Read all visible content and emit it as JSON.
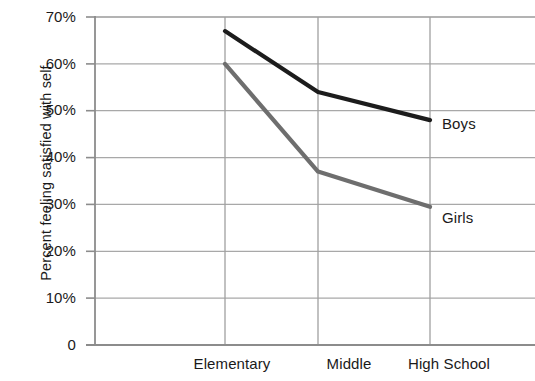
{
  "chart_data": {
    "type": "line",
    "title": "",
    "xlabel": "",
    "ylabel": "Percent feeling satisfied with self",
    "categories": [
      "Elementary",
      "Middle",
      "High School"
    ],
    "series": [
      {
        "name": "Boys",
        "values": [
          67,
          54,
          48
        ],
        "color": "#1c1c1c"
      },
      {
        "name": "Girls",
        "values": [
          60,
          37,
          29.5
        ],
        "color": "#6e6e6e"
      }
    ],
    "ylim": [
      0,
      70
    ],
    "ytick_values": [
      0,
      10,
      20,
      30,
      40,
      50,
      60,
      70
    ],
    "ytick_labels": [
      "0",
      "10%",
      "20%",
      "30%",
      "40%",
      "50%",
      "60%",
      "70%"
    ],
    "grid": "horizontal-and-category-verticals",
    "legend_position": "inline-right-of-last-point",
    "axis_color": "#8c8c8c",
    "grid_color": "#a8a8a8",
    "text_color": "#1a1a1a",
    "annotations": [
      {
        "text": "Boys",
        "anchor_category": "High School",
        "anchor_value": 48
      },
      {
        "text": "Girls",
        "anchor_category": "High School",
        "anchor_value": 29.5
      }
    ]
  }
}
